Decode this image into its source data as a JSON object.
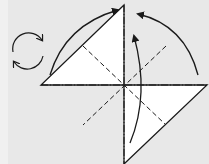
{
  "diagram": {
    "type": "origami-fold-diagram",
    "colors": {
      "background": "#e8e8e8",
      "paper": "#ffffff",
      "line": "#1a1a1a"
    },
    "paper_square": {
      "top": [
        124,
        5
      ],
      "left": [
        41,
        85
      ],
      "right": [
        207,
        85
      ],
      "bottom": [
        124,
        164
      ]
    },
    "folds": {
      "mountain_vertical": "dash-dot",
      "mountain_horizontal": "dash-dot",
      "valley_diagonals": "dashed"
    },
    "arrows": [
      {
        "name": "left-corner-to-top",
        "from": "left",
        "to": "top"
      },
      {
        "name": "right-corner-to-top",
        "from": "right",
        "to": "top"
      },
      {
        "name": "bottom-corner-up",
        "from": "bottom",
        "to": "center-top"
      }
    ],
    "symbol": "turn-over"
  }
}
